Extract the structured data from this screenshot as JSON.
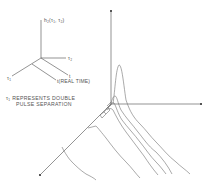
{
  "legend_axes": {
    "vertical_label": "h₂(τ₁, τ₂)",
    "tau2_label": "τ₂",
    "t_label": "t",
    "tau1_label": "τ₁",
    "real_time_label": "t(REAL TIME)"
  },
  "note": {
    "line1": "τ₁ REPRESENTS DOUBLE",
    "line2": "PULSE SEPARATION"
  },
  "plot": {
    "description": "3D waterfall plot of second-order kernel h2(τ1, τ2) with decaying traces along τ1 axis",
    "trace_count": 6,
    "line_color": "#6a6a6a"
  }
}
